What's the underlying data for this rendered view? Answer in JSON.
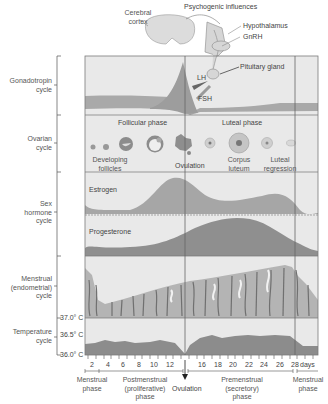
{
  "header": {
    "cerebral_cortex_line1": "Cerebral",
    "cerebral_cortex_line2": "cortex",
    "psychogenic": "Psychogenic influences",
    "hypothalamus": "Hypothalamus",
    "gnrh": "GnRH",
    "pituitary": "Pituitary gland"
  },
  "rows": {
    "gonadotropin": {
      "line1": "Gonadotropin",
      "line2": "cycle",
      "lh": "LH",
      "fsh": "FSH"
    },
    "ovarian": {
      "line1": "Ovarian",
      "line2": "cycle",
      "follicular_phase": "Follicular phase",
      "luteal_phase": "Luteal phase",
      "developing_line1": "Developing",
      "developing_line2": "follicles",
      "ovulation": "Ovulation",
      "corpus_line1": "Corpus",
      "corpus_line2": "luteum",
      "regression_line1": "Luteal",
      "regression_line2": "regression"
    },
    "sex_hormone": {
      "line1": "Sex",
      "line2": "hormone",
      "line3": "cycle",
      "estrogen": "Estrogen",
      "progesterone": "Progesterone"
    },
    "menstrual": {
      "line1": "Menstrual",
      "line2": "(endometrial)",
      "line3": "cycle"
    },
    "temperature": {
      "line1": "Temperature",
      "line2": "cycle",
      "t370": "37.0° C",
      "t365": "36.5° C",
      "t360": "36.0° C"
    }
  },
  "axis": {
    "ticks": [
      "2",
      "4",
      "6",
      "8",
      "10",
      "12",
      "16",
      "18",
      "20",
      "22",
      "24",
      "26",
      "28"
    ],
    "unit": "days"
  },
  "phases": {
    "menstrual1_line1": "Menstrual",
    "menstrual1_line2": "phase",
    "post_line1": "Postmenstrual",
    "post_line2": "(proliferative)",
    "post_line3": "phase",
    "ovulation": "Ovulation",
    "pre_line1": "Premenstrual",
    "pre_line2": "(secretory)",
    "pre_line3": "phase",
    "menstrual2_line1": "Menstrual",
    "menstrual2_line2": "phase"
  },
  "colors": {
    "panel_bg": "#e9e9e9",
    "fill_light": "#a8a8a8",
    "fill_dark": "#8c8c8c",
    "line": "#6e6e6e"
  }
}
